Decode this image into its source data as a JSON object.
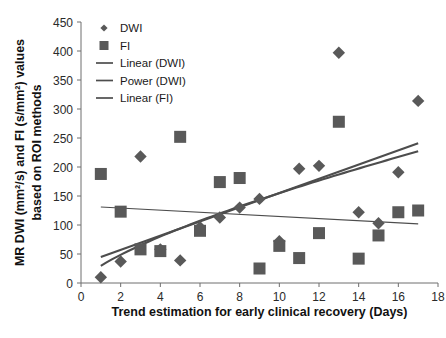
{
  "chart_data": {
    "type": "scatter",
    "title": "",
    "xlabel": "Trend estimation for early clinical recovery (Days)",
    "ylabel": "MR DWI (mm²/s) and FI (s/mm²) values based on ROI methods",
    "xlim": [
      0,
      18
    ],
    "ylim": [
      0,
      450
    ],
    "xticks": [
      0,
      2,
      4,
      6,
      8,
      10,
      12,
      14,
      16,
      18
    ],
    "yticks": [
      0,
      50,
      100,
      150,
      200,
      250,
      300,
      350,
      400,
      450
    ],
    "grid": false,
    "legend_position": "top-left",
    "marker_color": "#595959",
    "line_color": "#4d4d4d",
    "axis_color": "#6e6e6e",
    "series": [
      {
        "name": "DWI",
        "marker": "diamond",
        "points": [
          {
            "x": 1,
            "y": 10
          },
          {
            "x": 2,
            "y": 37
          },
          {
            "x": 3,
            "y": 218
          },
          {
            "x": 4,
            "y": 58
          },
          {
            "x": 5,
            "y": 39
          },
          {
            "x": 6,
            "y": 96
          },
          {
            "x": 7,
            "y": 113
          },
          {
            "x": 8,
            "y": 130
          },
          {
            "x": 9,
            "y": 145
          },
          {
            "x": 10,
            "y": 72
          },
          {
            "x": 11,
            "y": 197
          },
          {
            "x": 12,
            "y": 202
          },
          {
            "x": 13,
            "y": 397
          },
          {
            "x": 14,
            "y": 122
          },
          {
            "x": 15,
            "y": 103
          },
          {
            "x": 16,
            "y": 191
          },
          {
            "x": 17,
            "y": 314
          }
        ]
      },
      {
        "name": "FI",
        "marker": "square",
        "points": [
          {
            "x": 1,
            "y": 188
          },
          {
            "x": 2,
            "y": 123
          },
          {
            "x": 4,
            "y": 55
          },
          {
            "x": 5,
            "y": 252
          },
          {
            "x": 6,
            "y": 90
          },
          {
            "x": 7,
            "y": 174
          },
          {
            "x": 8,
            "y": 181
          },
          {
            "x": 9,
            "y": 25
          },
          {
            "x": 10,
            "y": 64
          },
          {
            "x": 11,
            "y": 43
          },
          {
            "x": 12,
            "y": 86
          },
          {
            "x": 13,
            "y": 278
          },
          {
            "x": 14,
            "y": 42
          },
          {
            "x": 15,
            "y": 82
          },
          {
            "x": 16,
            "y": 122
          },
          {
            "x": 17,
            "y": 125
          }
        ]
      },
      {
        "name": "FI-extra",
        "marker": "square",
        "points": [
          {
            "x": 3,
            "y": 58
          }
        ]
      }
    ],
    "trendlines": [
      {
        "name": "Linear (DWI)",
        "kind": "linear",
        "x_start": 1,
        "y_start": 45,
        "x_end": 17,
        "y_end": 241
      },
      {
        "name": "Power (DWI)",
        "kind": "power",
        "x_start": 1,
        "y_start": 10,
        "x_end": 17,
        "y_end": 227,
        "exponent": 0.72
      },
      {
        "name": "Linear (FI)",
        "kind": "linear",
        "x_start": 1,
        "y_start": 131,
        "x_end": 17,
        "y_end": 102
      }
    ]
  },
  "legend": {
    "items": [
      {
        "label": "DWI",
        "glyph": "diamond-marker"
      },
      {
        "label": "FI",
        "glyph": "square-marker"
      },
      {
        "label": "Linear (DWI)",
        "glyph": "line-swatch"
      },
      {
        "label": "Power (DWI)",
        "glyph": "line-swatch"
      },
      {
        "label": "Linear (FI)",
        "glyph": "line-swatch"
      }
    ]
  },
  "axes": {
    "x_title": "Trend estimation for early clinical recovery (Days)",
    "y_title_line1": "MR DWI (mm²/s) and FI (s/mm²) values",
    "y_title_line2": "based on ROI methods"
  }
}
